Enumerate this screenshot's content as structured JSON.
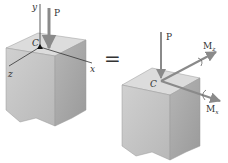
{
  "diagram": {
    "type": "statics-equivalent-force-couple-system",
    "left": {
      "axes": {
        "x": "x",
        "y": "y",
        "z": "z"
      },
      "point": "C",
      "force": "P"
    },
    "equals": "=",
    "right": {
      "point": "C",
      "force": "P",
      "moments": [
        {
          "label": "M",
          "sub": "z"
        },
        {
          "label": "M",
          "sub": "x"
        }
      ]
    },
    "colors": {
      "block_top": "#d9d9d9",
      "block_left": "#c4c4c4",
      "block_right": "#a9a9a9",
      "arrow": "#8a8a8a",
      "axis": "#333333"
    }
  }
}
